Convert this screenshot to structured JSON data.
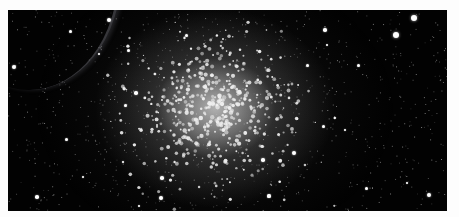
{
  "image": {
    "subject": "globular star cluster",
    "frame": {
      "x": 8,
      "y": 10,
      "width": 439,
      "height": 201,
      "background": "#020202",
      "page_background": "#fdfdfd"
    },
    "cluster_center": {
      "x": 207,
      "y": 98
    },
    "bright_stars": [
      {
        "x": 101,
        "y": 10,
        "r": 2
      },
      {
        "x": 62,
        "y": 21,
        "r": 1.5
      },
      {
        "x": 6,
        "y": 57,
        "r": 2
      },
      {
        "x": 120,
        "y": 40,
        "r": 1.5
      },
      {
        "x": 91,
        "y": 44,
        "r": 1.2
      },
      {
        "x": 178,
        "y": 25,
        "r": 1.5
      },
      {
        "x": 406,
        "y": 8,
        "r": 3
      },
      {
        "x": 388,
        "y": 25,
        "r": 3
      },
      {
        "x": 317,
        "y": 20,
        "r": 1.8
      },
      {
        "x": 319,
        "y": 35,
        "r": 1.2
      },
      {
        "x": 299,
        "y": 55,
        "r": 1.5
      },
      {
        "x": 350,
        "y": 55,
        "r": 1.5
      },
      {
        "x": 128,
        "y": 83,
        "r": 1.8
      },
      {
        "x": 117,
        "y": 95,
        "r": 1.5
      },
      {
        "x": 58,
        "y": 129,
        "r": 1.5
      },
      {
        "x": 29,
        "y": 187,
        "r": 1.8
      },
      {
        "x": 75,
        "y": 167,
        "r": 1.3
      },
      {
        "x": 115,
        "y": 152,
        "r": 1.3
      },
      {
        "x": 154,
        "y": 168,
        "r": 1.8
      },
      {
        "x": 153,
        "y": 188,
        "r": 2
      },
      {
        "x": 131,
        "y": 196,
        "r": 1.3
      },
      {
        "x": 286,
        "y": 143,
        "r": 2
      },
      {
        "x": 255,
        "y": 150,
        "r": 1.8
      },
      {
        "x": 315,
        "y": 116,
        "r": 1.5
      },
      {
        "x": 337,
        "y": 120,
        "r": 1.3
      },
      {
        "x": 358,
        "y": 178,
        "r": 1.5
      },
      {
        "x": 399,
        "y": 173,
        "r": 1.2
      },
      {
        "x": 421,
        "y": 185,
        "r": 2.2
      },
      {
        "x": 261,
        "y": 186,
        "r": 1.6
      },
      {
        "x": 280,
        "y": 213,
        "r": 2
      }
    ],
    "cluster_star_count": 520,
    "faint_star_count": 900,
    "seed": 42
  }
}
